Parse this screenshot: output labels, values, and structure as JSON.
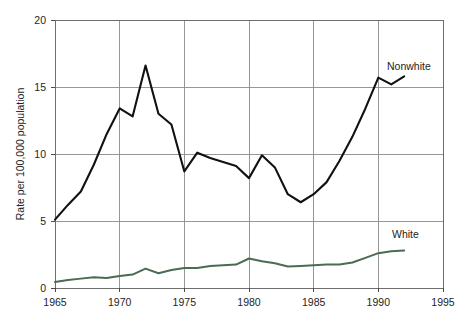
{
  "chart_data": {
    "type": "line",
    "title": "",
    "xlabel": "",
    "ylabel": "Rate per 100,000 population",
    "xlim": [
      1965,
      1995
    ],
    "ylim": [
      0,
      20
    ],
    "xticks": [
      1965,
      1970,
      1975,
      1980,
      1985,
      1990,
      1995
    ],
    "yticks": [
      0,
      5,
      10,
      15,
      20
    ],
    "xtick_labels": [
      "1965",
      "1970",
      "1975",
      "1980",
      "1985",
      "1990",
      "1995"
    ],
    "ytick_labels": [
      "0",
      "5",
      "10",
      "15",
      "20"
    ],
    "grid": true,
    "legend_position": "inline-right-labels",
    "x": [
      1965,
      1966,
      1967,
      1968,
      1969,
      1970,
      1971,
      1972,
      1973,
      1974,
      1975,
      1976,
      1977,
      1978,
      1979,
      1980,
      1981,
      1982,
      1983,
      1984,
      1985,
      1986,
      1987,
      1988,
      1989,
      1990,
      1991,
      1992
    ],
    "series": [
      {
        "name": "Nonwhite",
        "color": "#111111",
        "values": [
          5.1,
          6.2,
          7.2,
          9.2,
          11.5,
          13.4,
          12.8,
          16.6,
          13.0,
          12.2,
          8.7,
          10.1,
          9.7,
          9.4,
          9.1,
          8.2,
          9.9,
          9.0,
          7.0,
          6.4,
          7.0,
          7.9,
          9.5,
          11.3,
          13.4,
          15.7,
          15.2,
          15.8
        ]
      },
      {
        "name": "White",
        "color": "#4b6b52",
        "values": [
          0.45,
          0.6,
          0.7,
          0.8,
          0.75,
          0.9,
          1.0,
          1.45,
          1.1,
          1.35,
          1.5,
          1.5,
          1.65,
          1.7,
          1.75,
          2.2,
          2.0,
          1.85,
          1.6,
          1.65,
          1.7,
          1.75,
          1.75,
          1.9,
          2.25,
          2.6,
          2.75,
          2.8
        ]
      }
    ],
    "annotations": [
      {
        "text": "Nonwhite",
        "series": "Nonwhite"
      },
      {
        "text": "White",
        "series": "White"
      }
    ]
  },
  "axis": {
    "y_title": "Rate per 100,000 population"
  },
  "labels": {
    "nonwhite": "Nonwhite",
    "white": "White"
  },
  "footer": {
    "caption_fragment": ""
  }
}
